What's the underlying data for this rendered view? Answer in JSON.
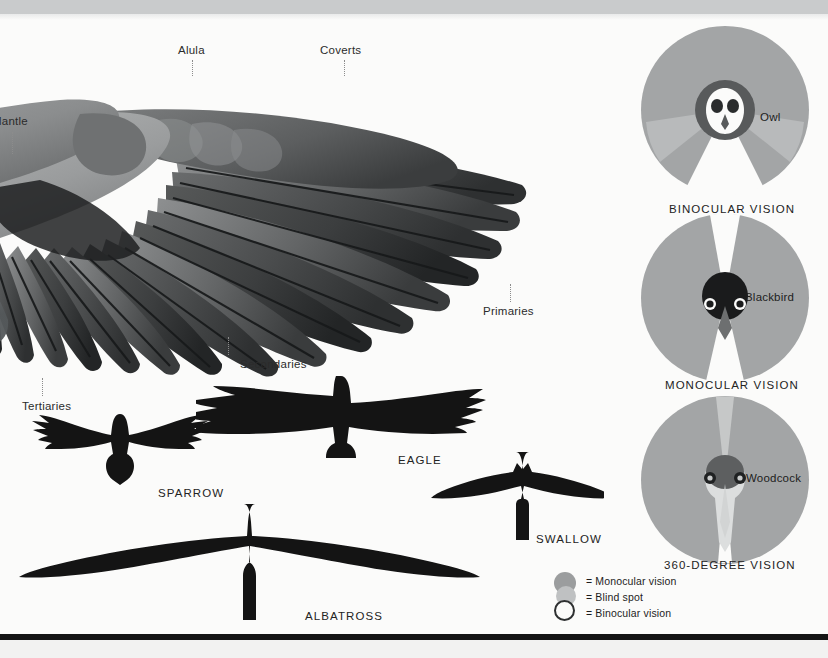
{
  "page": {
    "background": "#fbfbfa",
    "top_band_color": "#c9cbcc",
    "rule_color": "#151515"
  },
  "wing": {
    "title": "bird wing feather anatomy",
    "labels": [
      {
        "text": "Mantle",
        "x": 2,
        "y": 122,
        "leader_x": 12,
        "leader_y": 132,
        "leader_h": 22,
        "clipped": true
      },
      {
        "text": "Alula",
        "x": 178,
        "y": 51,
        "leader_x": 192,
        "leader_y": 60,
        "leader_h": 16,
        "clipped": false
      },
      {
        "text": "Coverts",
        "x": 320,
        "y": 51,
        "leader_x": 344,
        "leader_y": 60,
        "leader_h": 16,
        "clipped": false
      },
      {
        "text": "Primaries",
        "x": 483,
        "y": 311,
        "leader_x": 510,
        "leader_y": 286,
        "leader_h": 20,
        "clipped": false
      },
      {
        "text": "Secondaries",
        "x": 240,
        "y": 364,
        "leader_x": 228,
        "leader_y": 340,
        "leader_h": 20,
        "clipped": false
      },
      {
        "text": "Tertiaries",
        "x": 22,
        "y": 406,
        "leader_x": 42,
        "leader_y": 380,
        "leader_h": 20,
        "clipped": false
      }
    ]
  },
  "silhouettes": [
    {
      "name": "SPARROW",
      "label_x": 158,
      "label_y": 494
    },
    {
      "name": "EAGLE",
      "label_x": 398,
      "label_y": 461
    },
    {
      "name": "SWALLOW",
      "label_x": 536,
      "label_y": 540
    },
    {
      "name": "ALBATROSS",
      "label_x": 305,
      "label_y": 617
    }
  ],
  "vision": {
    "diagrams": [
      {
        "bird": "Owl",
        "caption": "BINOCULAR VISION",
        "bird_label_x": 760,
        "bird_label_y": 118,
        "caption_x": 724,
        "caption_y": 209,
        "cx": 724,
        "cy": 110,
        "r": 84,
        "monocular_color": "#a3a5a6",
        "blind_color": "#b8babb",
        "binocular_color": "#ffffff",
        "binocular_half_angle_deg": 26,
        "blind_half_angle_deg": 52
      },
      {
        "bird": "Blackbird",
        "caption": "MONOCULAR VISION",
        "bird_label_x": 745,
        "bird_label_y": 297,
        "caption_x": 724,
        "caption_y": 385,
        "cx": 724,
        "cy": 298,
        "r": 84,
        "monocular_color": "#a3a5a6",
        "blind_color": "#ffffff",
        "binocular_color": "#ffffff",
        "binocular_half_angle_deg": 9,
        "blind_half_angle_deg": 9
      },
      {
        "bird": "Woodcock",
        "caption": "360-DEGREE VISION",
        "bird_label_x": 746,
        "bird_label_y": 478,
        "caption_x": 724,
        "caption_y": 565,
        "cx": 724,
        "cy": 480,
        "r": 84,
        "monocular_color": "#a3a5a6",
        "blind_color": "#c3c5c5",
        "binocular_color": "#cfd1d1",
        "binocular_half_angle_deg": 4,
        "blind_half_angle_deg": 4
      }
    ]
  },
  "legend": {
    "items": [
      {
        "text": "= Monocular vision",
        "swatch": "monocular-swatch",
        "color": "#9b9d9e",
        "style": "filled"
      },
      {
        "text": "= Blind spot",
        "swatch": "blind-spot-swatch",
        "color": "#bfc1c2",
        "style": "filled"
      },
      {
        "text": "= Binocular vision",
        "swatch": "binocular-swatch",
        "color": "#ffffff",
        "style": "outlined"
      }
    ]
  }
}
